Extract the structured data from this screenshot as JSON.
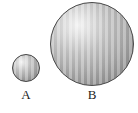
{
  "figure": {
    "background_color": "#ffffff",
    "width": 138,
    "height": 113,
    "caption": ""
  },
  "shapes": [
    {
      "id": "A",
      "kind": "sphere",
      "label": "A",
      "center_x": 26,
      "center_y": 68,
      "diameter": 28,
      "radius": 14,
      "fill_color": "#9e9e9e",
      "highlight_color": "#f2f2f2",
      "outline_color": "#4a4a4a",
      "fill_pattern": "vertical-hatch"
    },
    {
      "id": "B",
      "kind": "sphere",
      "label": "B",
      "center_x": 92,
      "center_y": 44,
      "diameter": 84,
      "radius": 42,
      "fill_color": "#9e9e9e",
      "highlight_color": "#f2f2f2",
      "outline_color": "#4a4a4a",
      "fill_pattern": "vertical-hatch"
    }
  ],
  "labels": {
    "a": "A",
    "b": "B"
  }
}
